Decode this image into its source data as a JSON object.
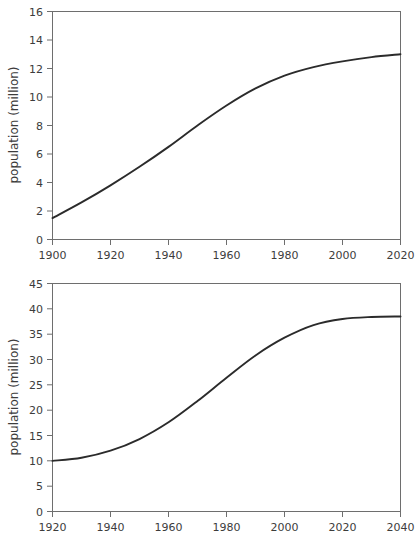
{
  "chart_data": [
    {
      "id": "top-chart",
      "type": "line",
      "title": "",
      "xlabel": "",
      "ylabel": "population (million)",
      "xlim": [
        1900,
        2020
      ],
      "ylim": [
        0,
        16
      ],
      "xticks": [
        1900,
        1920,
        1940,
        1960,
        1980,
        2000,
        2020
      ],
      "xticklabels": [
        "1900",
        "1920",
        "1940",
        "1960",
        "1980",
        "2000",
        "2020"
      ],
      "yticks": [
        0,
        2,
        4,
        6,
        8,
        10,
        12,
        14,
        16
      ],
      "yticklabels": [
        "0",
        "2",
        "4",
        "6",
        "8",
        "10",
        "12",
        "14",
        "16"
      ],
      "grid": false,
      "legend": null,
      "line_color": "#2b2b2b",
      "x": [
        1900,
        1910,
        1920,
        1930,
        1940,
        1950,
        1960,
        1970,
        1980,
        1990,
        2000,
        2010,
        2020
      ],
      "values": [
        1.5,
        2.6,
        3.8,
        5.1,
        6.5,
        8.0,
        9.4,
        10.6,
        11.5,
        12.1,
        12.5,
        12.8,
        13.0
      ]
    },
    {
      "id": "bottom-chart",
      "type": "line",
      "title": "",
      "xlabel": "",
      "ylabel": "population (million)",
      "xlim": [
        1920,
        2040
      ],
      "ylim": [
        0,
        45
      ],
      "xticks": [
        1920,
        1940,
        1960,
        1980,
        2000,
        2020,
        2040
      ],
      "xticklabels": [
        "1920",
        "1940",
        "1960",
        "1980",
        "2000",
        "2020",
        "2040"
      ],
      "yticks": [
        0,
        5,
        10,
        15,
        20,
        25,
        30,
        35,
        40,
        45
      ],
      "yticklabels": [
        "0",
        "5",
        "10",
        "15",
        "20",
        "25",
        "30",
        "35",
        "40",
        "45"
      ],
      "grid": false,
      "legend": null,
      "line_color": "#2b2b2b",
      "x": [
        1920,
        1930,
        1940,
        1950,
        1960,
        1970,
        1980,
        1990,
        2000,
        2010,
        2020,
        2030,
        2040
      ],
      "values": [
        10.0,
        10.6,
        12.0,
        14.3,
        17.6,
        21.8,
        26.4,
        30.8,
        34.3,
        36.8,
        38.0,
        38.4,
        38.5
      ]
    }
  ],
  "top": {
    "ylabel": "population (million)",
    "yticklabels": [
      "16",
      "14",
      "12",
      "10",
      "8",
      "6",
      "4",
      "2",
      "0"
    ],
    "xticklabels": [
      "1900",
      "1920",
      "1940",
      "1960",
      "1980",
      "2000",
      "2020"
    ]
  },
  "bottom": {
    "ylabel": "population (million)",
    "yticklabels": [
      "45",
      "40",
      "35",
      "30",
      "25",
      "20",
      "15",
      "10",
      "5",
      "0"
    ],
    "xticklabels": [
      "1920",
      "1940",
      "1960",
      "1980",
      "2000",
      "2020",
      "2040"
    ]
  }
}
